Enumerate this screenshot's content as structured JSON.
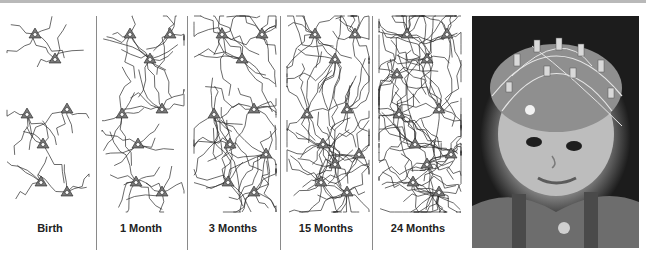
{
  "figure": {
    "panels": [
      {
        "label": "Birth",
        "density": 1,
        "seed": 11
      },
      {
        "label": "1 Month",
        "density": 2,
        "seed": 23
      },
      {
        "label": "3 Months",
        "density": 3,
        "seed": 37
      },
      {
        "label": "15 Months",
        "density": 4,
        "seed": 51
      },
      {
        "label": "24 Months",
        "density": 5,
        "seed": 67
      }
    ],
    "colors": {
      "line": "#2a2a2a",
      "soma": "#7a7a7a",
      "divider": "#8a8a8a",
      "topbar": "#b9b9b9"
    },
    "photo": {
      "description": "Infant wearing EEG electrode cap"
    }
  }
}
